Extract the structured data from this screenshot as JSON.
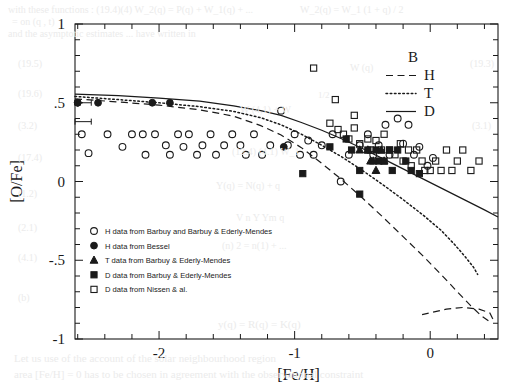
{
  "figure": {
    "ylabel": "[O/Fe]",
    "xlabel": "[Fe/H]",
    "xticks": [
      "-2",
      "-1",
      "0"
    ],
    "xtickvals": [
      -2,
      -1,
      0
    ],
    "yticks": [
      "1",
      ".5",
      "0",
      "-.5",
      "-1"
    ],
    "ytickvals": [
      1,
      0.5,
      0,
      -0.5,
      -1
    ]
  },
  "curve_legend": {
    "title": "B",
    "items": [
      {
        "label": "H",
        "style": "dashed"
      },
      {
        "label": "T",
        "style": "dotted"
      },
      {
        "label": "D",
        "style": "solid"
      }
    ]
  },
  "marker_legend": {
    "items": [
      {
        "marker": "open-circle",
        "label": "H data from Barbuy and Barbuy & Ederly-Mendes"
      },
      {
        "marker": "filled-circle",
        "label": "H data from Bessel"
      },
      {
        "marker": "filled-triangle",
        "label": "T data from Barbuy & Ederly-Mendes"
      },
      {
        "marker": "filled-square",
        "label": "D data from  Barbuy & Ederly-Mendes"
      },
      {
        "marker": "open-square",
        "label": "D data from Nissen & al."
      }
    ]
  },
  "colors": {
    "ink": "#1a1a1a",
    "background": "#ffffff",
    "bleed": "#ebebeb"
  },
  "chart_data": {
    "type": "scatter",
    "title": "",
    "xlabel": "[Fe/H]",
    "ylabel": "[O/Fe]",
    "xlim": [
      -2.62,
      0.5
    ],
    "ylim": [
      -1,
      1
    ],
    "grid": false,
    "legend_position": "top-right and inside-lower-left",
    "series": [
      {
        "name": "H data from Barbuy and Barbuy & Ederly-Mendes",
        "marker": "open-circle",
        "points": [
          [
            -2.57,
            0.3
          ],
          [
            -2.52,
            0.18
          ],
          [
            -2.38,
            0.3
          ],
          [
            -2.27,
            0.22
          ],
          [
            -2.2,
            0.3
          ],
          [
            -2.12,
            0.3
          ],
          [
            -2.1,
            0.17
          ],
          [
            -2.03,
            0.3
          ],
          [
            -1.95,
            0.23
          ],
          [
            -1.92,
            0.17
          ],
          [
            -1.86,
            0.3
          ],
          [
            -1.82,
            0.22
          ],
          [
            -1.78,
            0.3
          ],
          [
            -1.72,
            0.17
          ],
          [
            -1.68,
            0.23
          ],
          [
            -1.62,
            0.3
          ],
          [
            -1.58,
            0.17
          ],
          [
            -1.52,
            0.23
          ],
          [
            -1.46,
            0.3
          ],
          [
            -1.4,
            0.23
          ],
          [
            -1.36,
            0.17
          ],
          [
            -1.3,
            0.3
          ],
          [
            -1.24,
            0.17
          ],
          [
            -1.18,
            0.23
          ],
          [
            -1.1,
            0.45
          ],
          [
            -1.05,
            0.23
          ],
          [
            -1.0,
            0.3
          ],
          [
            -0.96,
            0.17
          ],
          [
            -0.9,
            0.26
          ],
          [
            -0.86,
            0.17
          ],
          [
            -0.8,
            0.23
          ],
          [
            -0.72,
            0.3
          ],
          [
            -0.66,
            0.0
          ],
          [
            -0.6,
            0.17
          ],
          [
            -0.52,
            0.23
          ],
          [
            -0.46,
            0.3
          ],
          [
            -0.42,
            0.17
          ],
          [
            -0.38,
            0.23
          ],
          [
            -0.33,
            0.36
          ],
          [
            -0.3,
            0.17
          ],
          [
            -0.24,
            0.4
          ],
          [
            -0.2,
            0.24
          ],
          [
            -0.16,
            0.36
          ],
          [
            -0.12,
            0.17
          ],
          [
            -0.08,
            0.22
          ],
          [
            -0.02,
            0.1
          ],
          [
            0.02,
            0.15
          ]
        ]
      },
      {
        "name": "H data from Bessel",
        "marker": "filled-circle",
        "points": [
          [
            -2.6,
            0.5
          ],
          [
            -2.45,
            0.5
          ],
          [
            -2.05,
            0.5
          ],
          [
            -1.92,
            0.5
          ],
          [
            -1.08,
            0.22
          ]
        ]
      },
      {
        "name": "T data from Barbuy & Ederly-Mendes",
        "marker": "filled-triangle",
        "points": [
          [
            -0.52,
            0.2
          ],
          [
            -0.46,
            0.2
          ],
          [
            -0.44,
            0.13
          ],
          [
            -0.42,
            0.13
          ],
          [
            -0.4,
            0.07
          ],
          [
            -0.36,
            0.2
          ],
          [
            -0.34,
            0.13
          ]
        ]
      },
      {
        "name": "D data from  Barbuy & Ederly-Mendes",
        "marker": "filled-square",
        "points": [
          [
            -0.94,
            0.05
          ],
          [
            -0.74,
            0.22
          ],
          [
            -0.62,
            0.27
          ],
          [
            -0.58,
            0.2
          ],
          [
            -0.52,
            0.07
          ],
          [
            -0.46,
            0.2
          ],
          [
            -0.4,
            0.2
          ],
          [
            -0.38,
            0.13
          ],
          [
            -0.34,
            0.13
          ],
          [
            -0.3,
            0.2
          ],
          [
            -0.28,
            0.07
          ],
          [
            -0.24,
            0.2
          ],
          [
            -0.18,
            0.13
          ],
          [
            -0.14,
            0.07
          ],
          [
            -0.52,
            -0.08
          ],
          [
            -0.08,
            0.05
          ]
        ]
      },
      {
        "name": "D data from Nissen & al.",
        "marker": "open-square",
        "points": [
          [
            -0.86,
            0.72
          ],
          [
            -0.7,
            0.52
          ],
          [
            -0.74,
            0.37
          ],
          [
            -0.68,
            0.33
          ],
          [
            -0.64,
            0.3
          ],
          [
            -0.6,
            0.27
          ],
          [
            -0.56,
            0.34
          ],
          [
            -0.52,
            0.24
          ],
          [
            -0.46,
            0.27
          ],
          [
            -0.44,
            0.2
          ],
          [
            -0.4,
            0.26
          ],
          [
            -0.36,
            0.2
          ],
          [
            -0.34,
            0.3
          ],
          [
            -0.3,
            0.2
          ],
          [
            -0.26,
            0.17
          ],
          [
            -0.22,
            0.24
          ],
          [
            -0.2,
            0.13
          ],
          [
            -0.16,
            0.2
          ],
          [
            -0.14,
            0.1
          ],
          [
            -0.1,
            0.2
          ],
          [
            -0.06,
            0.13
          ],
          [
            -0.04,
            0.07
          ],
          [
            0.0,
            0.07
          ],
          [
            0.04,
            0.13
          ],
          [
            0.08,
            0.07
          ],
          [
            0.12,
            0.2
          ],
          [
            0.16,
            0.07
          ],
          [
            0.2,
            0.13
          ],
          [
            0.24,
            0.2
          ],
          [
            0.3,
            0.07
          ],
          [
            0.36,
            0.13
          ],
          [
            -0.56,
            0.42
          ]
        ]
      }
    ],
    "curves": [
      {
        "name": "H",
        "style": "dashed",
        "points": [
          [
            -2.62,
            0.525
          ],
          [
            -2.3,
            0.505
          ],
          [
            -2.0,
            0.485
          ],
          [
            -1.7,
            0.455
          ],
          [
            -1.45,
            0.415
          ],
          [
            -1.25,
            0.355
          ],
          [
            -1.1,
            0.295
          ],
          [
            -0.95,
            0.215
          ],
          [
            -0.8,
            0.115
          ],
          [
            -0.65,
            0.01
          ],
          [
            -0.5,
            -0.105
          ],
          [
            -0.35,
            -0.225
          ],
          [
            -0.2,
            -0.35
          ],
          [
            -0.05,
            -0.475
          ],
          [
            0.08,
            -0.59
          ],
          [
            0.2,
            -0.7
          ],
          [
            0.3,
            -0.79
          ],
          [
            0.38,
            -0.855
          ],
          [
            0.43,
            -0.885
          ],
          [
            0.46,
            -0.87
          ],
          [
            0.44,
            -0.835
          ],
          [
            0.36,
            -0.81
          ],
          [
            0.24,
            -0.8
          ],
          [
            0.12,
            -0.81
          ],
          [
            0.02,
            -0.83
          ],
          [
            -0.06,
            -0.845
          ]
        ]
      },
      {
        "name": "T",
        "style": "dotted",
        "points": [
          [
            -2.62,
            0.54
          ],
          [
            -2.3,
            0.52
          ],
          [
            -2.0,
            0.5
          ],
          [
            -1.7,
            0.475
          ],
          [
            -1.45,
            0.445
          ],
          [
            -1.25,
            0.405
          ],
          [
            -1.1,
            0.36
          ],
          [
            -0.95,
            0.3
          ],
          [
            -0.8,
            0.23
          ],
          [
            -0.65,
            0.155
          ],
          [
            -0.5,
            0.07
          ],
          [
            -0.35,
            -0.02
          ],
          [
            -0.2,
            -0.115
          ],
          [
            -0.05,
            -0.215
          ],
          [
            0.08,
            -0.31
          ],
          [
            0.18,
            -0.4
          ],
          [
            0.26,
            -0.48
          ],
          [
            0.32,
            -0.545
          ],
          [
            0.35,
            -0.59
          ]
        ]
      },
      {
        "name": "D",
        "style": "solid",
        "points": [
          [
            -2.62,
            0.555
          ],
          [
            -2.3,
            0.545
          ],
          [
            -2.0,
            0.53
          ],
          [
            -1.7,
            0.51
          ],
          [
            -1.45,
            0.48
          ],
          [
            -1.25,
            0.45
          ],
          [
            -1.1,
            0.42
          ],
          [
            -0.95,
            0.375
          ],
          [
            -0.8,
            0.325
          ],
          [
            -0.65,
            0.27
          ],
          [
            -0.5,
            0.21
          ],
          [
            -0.35,
            0.145
          ],
          [
            -0.2,
            0.08
          ],
          [
            -0.05,
            0.015
          ],
          [
            0.1,
            -0.05
          ],
          [
            0.25,
            -0.115
          ],
          [
            0.4,
            -0.18
          ],
          [
            0.5,
            -0.225
          ]
        ]
      }
    ],
    "errorbars": [
      {
        "x": -2.6,
        "y": 0.5,
        "xerr": 0.1,
        "marker": "filled-circle"
      },
      {
        "x": -2.6,
        "y": 0.38,
        "xerr": 0.1,
        "marker": "none"
      }
    ]
  },
  "bleed_text": [
    {
      "text": "with these functions :   (19.4)(4)   W_2(q) = P(q) + W_1(q) + ...",
      "x": 8,
      "y": 4,
      "size": 10
    },
    {
      "text": "= on (q , t)",
      "x": 12,
      "y": 16,
      "size": 10
    },
    {
      "text": "and the asymptotic estimates ... have written in",
      "x": 8,
      "y": 28,
      "size": 10
    },
    {
      "text": "(19.5)",
      "x": 18,
      "y": 58,
      "size": 10
    },
    {
      "text": "(19.6)",
      "x": 18,
      "y": 88,
      "size": 10
    },
    {
      "text": "(3.2)",
      "x": 18,
      "y": 120,
      "size": 10
    },
    {
      "text": "(17.4)",
      "x": 18,
      "y": 152,
      "size": 10
    },
    {
      "text": "(1.2)",
      "x": 18,
      "y": 188,
      "size": 10
    },
    {
      "text": "(2.1)",
      "x": 18,
      "y": 222,
      "size": 10
    },
    {
      "text": "(4.1)",
      "x": 18,
      "y": 252,
      "size": 10
    },
    {
      "text": "(b)",
      "x": 18,
      "y": 292,
      "size": 10
    },
    {
      "text": "W (4,1) + W",
      "x": 240,
      "y": 104,
      "size": 10
    },
    {
      "text": "(12.4) (4.1)   W_1",
      "x": 232,
      "y": 146,
      "size": 10
    },
    {
      "text": "Y(q) = N(q) + q",
      "x": 216,
      "y": 180,
      "size": 10
    },
    {
      "text": "V n Y Ym  q",
      "x": 236,
      "y": 212,
      "size": 10
    },
    {
      "text": "(n) 2 = n(1) + ... ",
      "x": 222,
      "y": 240,
      "size": 10
    },
    {
      "text": "y(q) = R(q) = K(q)",
      "x": 218,
      "y": 318,
      "size": 11
    },
    {
      "text": "Let us use of the account of the solar neighbourhood region",
      "x": 14,
      "y": 352,
      "size": 11
    },
    {
      "text": "area [Fe/H] = 0 has to be chosen in agreement with the observational constraint",
      "x": 14,
      "y": 368,
      "size": 11
    },
    {
      "text": "W_2(q) = W_1 (1 + q) / 2",
      "x": 300,
      "y": 4,
      "size": 10
    },
    {
      "text": "(19.3)",
      "x": 470,
      "y": 58,
      "size": 10
    },
    {
      "text": "(3.1)",
      "x": 472,
      "y": 120,
      "size": 10
    },
    {
      "text": "W (q)",
      "x": 350,
      "y": 62,
      "size": 10
    },
    {
      "text": "1/2",
      "x": 318,
      "y": 90,
      "size": 9
    }
  ]
}
